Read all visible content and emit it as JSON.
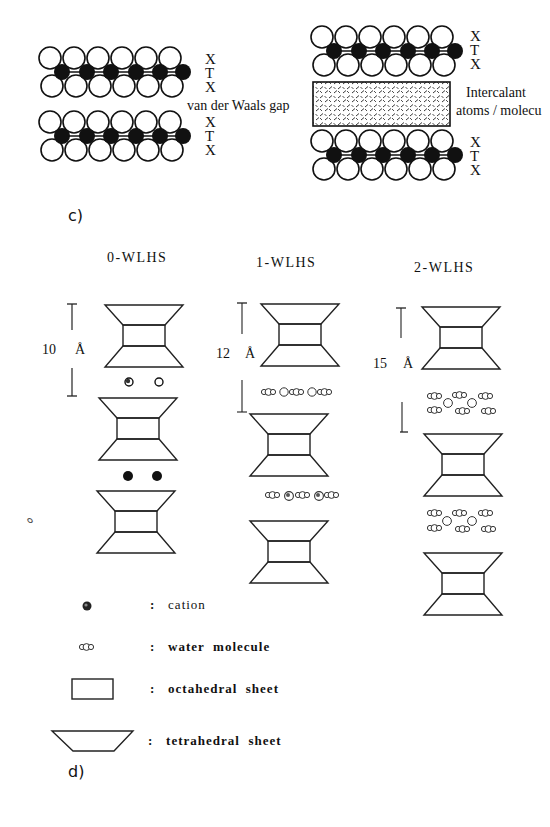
{
  "panel_top": {
    "left_stack": {
      "layer_labels_upper": [
        "X",
        "T",
        "X"
      ],
      "layer_labels_lower": [
        "X",
        "T",
        "X"
      ],
      "gap_label": "van der Waals gap"
    },
    "right_stack": {
      "layer_labels_upper": [
        "X",
        "T",
        "X"
      ],
      "layer_labels_lower": [
        "X",
        "T",
        "X"
      ],
      "intercalant_label_line1": "Intercalant",
      "intercalant_label_line2": "atoms / molecu"
    }
  },
  "panel_c": {
    "label": "c)",
    "columns": [
      {
        "title": "0-WLHS",
        "spacing_value": "10",
        "spacing_unit": "Å"
      },
      {
        "title": "1-WLHS",
        "spacing_value": "12",
        "spacing_unit": "Å"
      },
      {
        "title": "2-WLHS",
        "spacing_value": "15",
        "spacing_unit": "Å"
      }
    ]
  },
  "legend": {
    "items": [
      {
        "symbol": "cation-icon",
        "separator": ":",
        "text": "cation"
      },
      {
        "symbol": "water-molecule-icon",
        "separator": ":",
        "text": "water  molecule"
      },
      {
        "symbol": "octahedral-sheet-icon",
        "separator": ":",
        "text": "octahedral  sheet"
      },
      {
        "symbol": "tetrahedral-sheet-icon",
        "separator": ":",
        "text": "tetrahedral  sheet"
      }
    ]
  },
  "panel_d": {
    "label": "d)"
  },
  "colors": {
    "ink": "#111111",
    "background": "#ffffff"
  }
}
